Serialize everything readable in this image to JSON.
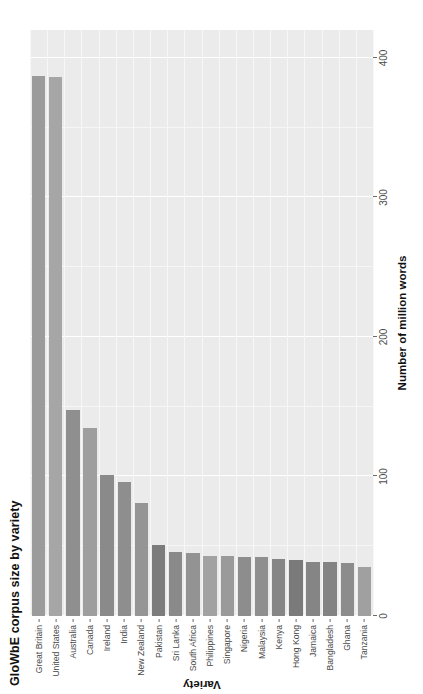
{
  "chart_data": {
    "type": "bar",
    "title": "GloWbE corpus size by variety",
    "xlabel": "Variety",
    "ylabel": "Number of million words",
    "orientation": "vertical-rendered-rotated",
    "grid": true,
    "legend": "none",
    "ylim": [
      0,
      420
    ],
    "yticks": [
      0,
      100,
      200,
      300,
      400
    ],
    "ytick_labels": [
      "0",
      "100",
      "200",
      "300",
      "400"
    ],
    "categories": [
      "Great Britain",
      "United States",
      "Australia",
      "Canada",
      "Ireland",
      "India",
      "New Zealand",
      "Pakistan",
      "Sri Lanka",
      "South Africa",
      "Philippines",
      "Singapore",
      "Nigeria",
      "Malaysia",
      "Kenya",
      "Hong Kong",
      "Jamaica",
      "Bangladesh",
      "Ghana",
      "Tanzania"
    ],
    "values": [
      387,
      386,
      148,
      135,
      101,
      96,
      81,
      51,
      46,
      45,
      43,
      43,
      42,
      42,
      41,
      40,
      39,
      39,
      38,
      35
    ],
    "bar_colors": [
      "#9b9b9b",
      "#a6a6a6",
      "#8f8f8f",
      "#9e9e9e",
      "#8a8a8a",
      "#8e8e8e",
      "#959595",
      "#7c7c7c",
      "#8a8a8a",
      "#939393",
      "#a2a2a2",
      "#9a9a9a",
      "#8d8d8d",
      "#8f8f8f",
      "#868686",
      "#7a7a7a",
      "#858585",
      "#838383",
      "#8c8c8c",
      "#a0a0a0"
    ],
    "panel_background": "#ebebeb",
    "gridline_color": "#ffffff"
  }
}
